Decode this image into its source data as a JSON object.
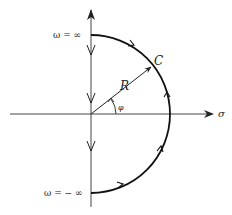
{
  "diagram": {
    "labels": {
      "omega_pos": "ω  =  ∞",
      "omega_neg": "ω  =  −  ∞",
      "contour": "C",
      "radius": "R",
      "angle": "φ",
      "sigma_axis": "σ"
    },
    "colors": {
      "stroke": "#222222",
      "background": "#ffffff"
    }
  }
}
